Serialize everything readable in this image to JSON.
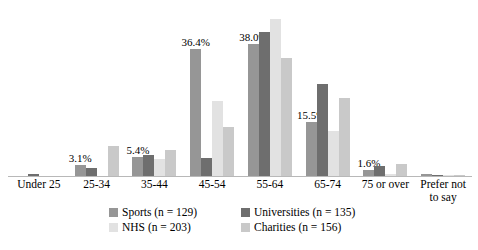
{
  "chart_data": {
    "type": "bar",
    "title": "",
    "subtitle": "",
    "xlabel": "",
    "ylabel": "",
    "ylim": [
      0,
      46
    ],
    "grid": false,
    "legend_position": "bottom",
    "categories": [
      "Under 25",
      "25-34",
      "35-44",
      "45-54",
      "55-64",
      "65-74",
      "75 or over",
      "Prefer not to say"
    ],
    "category_lines": [
      [
        "Under 25"
      ],
      [
        "25-34"
      ],
      [
        "35-44"
      ],
      [
        "45-54"
      ],
      [
        "55-64"
      ],
      [
        "65-74"
      ],
      [
        "75 or over"
      ],
      [
        "Prefer not",
        "to say"
      ]
    ],
    "series": [
      {
        "name": "Sports (n = 129)",
        "short_name": "Sports",
        "color": "#969696",
        "values": [
          0.0,
          3.1,
          5.4,
          36.4,
          38.0,
          15.5,
          1.6,
          0.5
        ],
        "labels": [
          "",
          "3.1%",
          "5.4%",
          "36.4%",
          "38.0%",
          "15.5%",
          "1.6%",
          ""
        ]
      },
      {
        "name": "Universities (n = 135)",
        "short_name": "Universities",
        "color": "#6e6e6e",
        "values": [
          0.7,
          2.2,
          6.0,
          5.2,
          41.5,
          26.5,
          3.0,
          0.4
        ],
        "labels": [
          "",
          "",
          "",
          "",
          "",
          "",
          "",
          ""
        ]
      },
      {
        "name": "NHS (n = 203)",
        "short_name": "NHS",
        "color": "#e2e2e2",
        "values": [
          0.0,
          0.0,
          5.0,
          21.5,
          45.0,
          13.0,
          0.5,
          0.3
        ],
        "labels": [
          "",
          "",
          "",
          "",
          "",
          "",
          "",
          ""
        ]
      },
      {
        "name": "Charities (n = 156)",
        "short_name": "Charities",
        "color": "#c9c9c9",
        "values": [
          0.0,
          8.5,
          7.5,
          14.0,
          34.0,
          22.5,
          3.5,
          0.4
        ],
        "labels": [
          "",
          "",
          "",
          "",
          "",
          "",
          "",
          ""
        ]
      }
    ]
  },
  "legend": {
    "rows": [
      [
        "Sports (n = 129)",
        "Universities (n = 135)"
      ],
      [
        "NHS (n = 203)",
        "Charities (n = 156)"
      ]
    ]
  }
}
